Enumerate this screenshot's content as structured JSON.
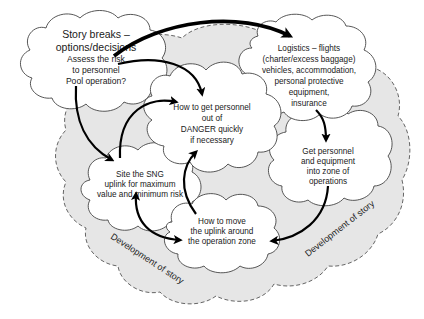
{
  "diagram": {
    "type": "cloud-flow-diagram",
    "background_color": "#ffffff",
    "band_color": "#e6e6e6",
    "band_label_left": "Development of story",
    "band_label_right": "Development of story",
    "nodes": {
      "story_breaks": {
        "lines": [
          "Story breaks –",
          "options/decisions",
          "Assess the risk",
          "to personnel",
          "Pool operation?"
        ]
      },
      "logistics": {
        "lines": [
          "Logistics – flights",
          "(charter/excess baggage)",
          "vehicles, accommodation,",
          "personal protective",
          "equipment,",
          "insurance"
        ]
      },
      "danger": {
        "lines": [
          "How to get personnel",
          "out of",
          "DANGER quickly",
          "if necessary"
        ]
      },
      "get_personnel": {
        "lines": [
          "Get personnel",
          "and equipment",
          "into zone of",
          "operations"
        ]
      },
      "site_sng": {
        "lines": [
          "Site the SNG",
          "uplink for maximum",
          "value and minimum risk"
        ]
      },
      "move_uplink": {
        "lines": [
          "How to move",
          "the uplink around",
          "the operation zone"
        ]
      }
    },
    "edges": [
      {
        "from": "story_breaks",
        "to": "logistics",
        "style": "thick"
      },
      {
        "from": "story_breaks",
        "to": "danger"
      },
      {
        "from": "story_breaks",
        "to": "site_sng"
      },
      {
        "from": "site_sng",
        "to": "danger"
      },
      {
        "from": "logistics",
        "to": "get_personnel"
      },
      {
        "from": "get_personnel",
        "to": "move_uplink"
      },
      {
        "from": "move_uplink",
        "to": "danger"
      },
      {
        "from": "site_sng",
        "to": "move_uplink",
        "bidirectional": true
      }
    ]
  }
}
